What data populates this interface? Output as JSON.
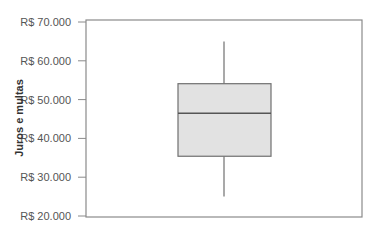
{
  "chart_data": {
    "type": "box",
    "title": "",
    "xlabel": "",
    "ylabel": "Juros e multas",
    "ylim": [
      20000,
      70000
    ],
    "y_ticks": [
      20000,
      30000,
      40000,
      50000,
      60000,
      70000
    ],
    "y_tick_labels": [
      "R$ 20.000",
      "R$ 30.000",
      "R$ 40.000",
      "R$ 50.000",
      "R$ 60.000",
      "R$ 70.000"
    ],
    "grid": false,
    "legend": null,
    "series": [
      {
        "name": "Juros e multas",
        "whisker_low": 25000,
        "q1": 35400,
        "median": 46500,
        "q3": 54100,
        "whisker_high": 65000
      }
    ],
    "colors": {
      "box_fill": "#e2e2e2",
      "box_stroke": "#707070",
      "axis": "#8a8a8a"
    }
  }
}
